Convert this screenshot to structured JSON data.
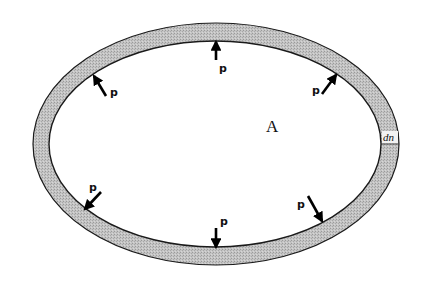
{
  "diagram": {
    "region_label": "A",
    "thickness_label": "dn",
    "pressure_label": "p",
    "colors": {
      "wall_fill": "#bdbdbd",
      "outline": "#1a1a1a",
      "arrow": "#000000",
      "background": "#ffffff"
    },
    "outer_ellipse": {
      "cx": 216,
      "cy": 144,
      "rx": 183,
      "ry": 121
    },
    "inner_ellipse": {
      "cx": 215,
      "cy": 144,
      "rx": 166,
      "ry": 103
    },
    "arrows": [
      {
        "id": "top",
        "label": "p",
        "tail": [
          216,
          60
        ],
        "tip": [
          216,
          42
        ],
        "label_pos": [
          219,
          72
        ]
      },
      {
        "id": "upper-right",
        "label": "p",
        "tail": [
          322,
          94
        ],
        "tip": [
          336,
          75
        ],
        "label_pos": [
          312,
          94
        ]
      },
      {
        "id": "upper-left",
        "label": "p",
        "tail": [
          106,
          96
        ],
        "tip": [
          94,
          76
        ],
        "label_pos": [
          110,
          96
        ]
      },
      {
        "id": "lower-left",
        "label": "p",
        "tail": [
          101,
          192
        ],
        "tip": [
          85,
          209
        ],
        "label_pos": [
          89,
          191
        ]
      },
      {
        "id": "lower-right",
        "label": "p",
        "tail": [
          308,
          196
        ],
        "tip": [
          322,
          221
        ],
        "label_pos": [
          297,
          208
        ]
      },
      {
        "id": "bottom",
        "label": "p",
        "tail": [
          216,
          228
        ],
        "tip": [
          216,
          247
        ],
        "label_pos": [
          220,
          225
        ]
      }
    ]
  }
}
